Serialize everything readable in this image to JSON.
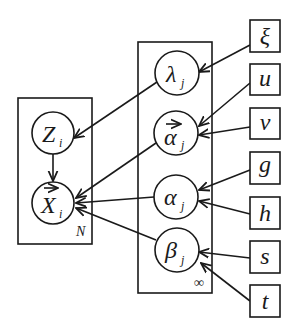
{
  "diagram": {
    "type": "plate-notation graphical model",
    "plates": [
      {
        "id": "plate-i",
        "label": "N",
        "contains": [
          "Z",
          "X"
        ]
      },
      {
        "id": "plate-j",
        "label": "∞",
        "contains": [
          "lambda",
          "alpha_vec",
          "alpha",
          "beta"
        ]
      }
    ],
    "nodes": [
      {
        "id": "Z",
        "symbol": "Z",
        "subscript": "i",
        "vector": false
      },
      {
        "id": "X",
        "symbol": "X",
        "subscript": "i",
        "vector": true
      },
      {
        "id": "lambda",
        "symbol": "λ",
        "subscript": "j",
        "vector": false
      },
      {
        "id": "alpha_vec",
        "symbol": "α",
        "subscript": "j",
        "vector": true
      },
      {
        "id": "alpha",
        "symbol": "α",
        "subscript": "j",
        "vector": false
      },
      {
        "id": "beta",
        "symbol": "β",
        "subscript": "j",
        "vector": false
      }
    ],
    "hyperparameters": [
      {
        "id": "xi",
        "symbol": "ξ"
      },
      {
        "id": "u",
        "symbol": "u"
      },
      {
        "id": "v",
        "symbol": "v"
      },
      {
        "id": "g",
        "symbol": "g"
      },
      {
        "id": "h",
        "symbol": "h"
      },
      {
        "id": "s",
        "symbol": "s"
      },
      {
        "id": "t",
        "symbol": "t"
      }
    ],
    "edges": [
      {
        "from": "xi",
        "to": "lambda"
      },
      {
        "from": "u",
        "to": "alpha_vec"
      },
      {
        "from": "v",
        "to": "alpha_vec"
      },
      {
        "from": "g",
        "to": "alpha"
      },
      {
        "from": "h",
        "to": "alpha"
      },
      {
        "from": "s",
        "to": "beta"
      },
      {
        "from": "t",
        "to": "beta"
      },
      {
        "from": "lambda",
        "to": "Z"
      },
      {
        "from": "Z",
        "to": "X"
      },
      {
        "from": "alpha_vec",
        "to": "X"
      },
      {
        "from": "alpha",
        "to": "X"
      },
      {
        "from": "beta",
        "to": "X"
      }
    ]
  }
}
